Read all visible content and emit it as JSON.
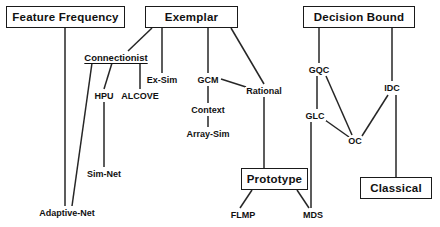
{
  "diagram": {
    "style": {
      "background": "#ffffff",
      "line_color": "#262626",
      "text_color": "#111111",
      "box_border": "#1a1a1a"
    },
    "boxes": [
      {
        "id": "feature-frequency",
        "label": "Feature Frequency",
        "x": 6,
        "y": 6,
        "w": 119,
        "h": 22,
        "font_size": 11.5
      },
      {
        "id": "exemplar",
        "label": "Exemplar",
        "x": 145,
        "y": 6,
        "w": 93,
        "h": 22,
        "font_size": 11.5
      },
      {
        "id": "decision-bound",
        "label": "Decision Bound",
        "x": 303,
        "y": 6,
        "w": 112,
        "h": 22,
        "font_size": 11.5
      },
      {
        "id": "prototype",
        "label": "Prototype",
        "x": 241,
        "y": 168,
        "w": 67,
        "h": 22,
        "font_size": 11.5
      },
      {
        "id": "classical",
        "label": "Classical",
        "x": 360,
        "y": 177,
        "w": 72,
        "h": 22,
        "font_size": 11.5
      }
    ],
    "labels": [
      {
        "id": "connectionist",
        "label": "Connectionist",
        "cx": 116,
        "cy": 58,
        "font_size": 9.5,
        "underlined": true
      },
      {
        "id": "hpu",
        "label": "HPU",
        "cx": 104,
        "cy": 96,
        "font_size": 9,
        "underlined": false
      },
      {
        "id": "alcove",
        "label": "ALCOVE",
        "cx": 140,
        "cy": 96,
        "font_size": 9,
        "underlined": false
      },
      {
        "id": "ex-sim",
        "label": "Ex-Sim",
        "cx": 162,
        "cy": 80,
        "font_size": 9,
        "underlined": false
      },
      {
        "id": "gcm",
        "label": "GCM",
        "cx": 208,
        "cy": 80,
        "font_size": 9,
        "underlined": false
      },
      {
        "id": "context",
        "label": "Context",
        "cx": 208,
        "cy": 110,
        "font_size": 9,
        "underlined": false
      },
      {
        "id": "array-sim",
        "label": "Array-Sim",
        "cx": 208,
        "cy": 134,
        "font_size": 9,
        "underlined": false
      },
      {
        "id": "rational",
        "label": "Rational",
        "cx": 264,
        "cy": 91,
        "font_size": 9,
        "underlined": false
      },
      {
        "id": "sim-net",
        "label": "Sim-Net",
        "cx": 104,
        "cy": 174,
        "font_size": 9,
        "underlined": false
      },
      {
        "id": "adaptive-net",
        "label": "Adaptive-Net",
        "cx": 67,
        "cy": 213,
        "font_size": 9,
        "underlined": false
      },
      {
        "id": "flmp",
        "label": "FLMP",
        "cx": 243,
        "cy": 215,
        "font_size": 9,
        "underlined": false
      },
      {
        "id": "mds",
        "label": "MDS",
        "cx": 313,
        "cy": 215,
        "font_size": 9,
        "underlined": false
      },
      {
        "id": "gqc",
        "label": "GQC",
        "cx": 319,
        "cy": 70,
        "font_size": 9,
        "underlined": false
      },
      {
        "id": "glc",
        "label": "GLC",
        "cx": 315,
        "cy": 116,
        "font_size": 9,
        "underlined": false
      },
      {
        "id": "oc",
        "label": "OC",
        "cx": 355,
        "cy": 141,
        "font_size": 9,
        "underlined": false
      },
      {
        "id": "idc",
        "label": "IDC",
        "cx": 392,
        "cy": 88,
        "font_size": 9,
        "underlined": false
      }
    ],
    "edges": [
      {
        "id": "feature-frequency-to-adaptive-net",
        "from": "feature-frequency",
        "to": "adaptive-net",
        "x1": 65,
        "y1": 28,
        "x2": 65,
        "y2": 206
      },
      {
        "id": "exemplar-to-connectionist",
        "from": "exemplar",
        "to": "connectionist",
        "x1": 152,
        "y1": 28,
        "x2": 128,
        "y2": 51
      },
      {
        "id": "exemplar-to-ex-sim",
        "from": "exemplar",
        "to": "ex-sim",
        "x1": 162,
        "y1": 28,
        "x2": 162,
        "y2": 73
      },
      {
        "id": "exemplar-to-gcm",
        "from": "exemplar",
        "to": "gcm",
        "x1": 208,
        "y1": 28,
        "x2": 208,
        "y2": 73
      },
      {
        "id": "exemplar-to-rational",
        "from": "exemplar",
        "to": "rational",
        "x1": 231,
        "y1": 28,
        "x2": 264,
        "y2": 84
      },
      {
        "id": "connectionist-to-adaptive-net",
        "from": "connectionist",
        "to": "adaptive-net",
        "x1": 92,
        "y1": 63,
        "x2": 72,
        "y2": 206
      },
      {
        "id": "connectionist-to-hpu",
        "from": "connectionist",
        "to": "hpu",
        "x1": 112,
        "y1": 63,
        "x2": 104,
        "y2": 89
      },
      {
        "id": "connectionist-to-alcove",
        "from": "connectionist",
        "to": "alcove",
        "x1": 140,
        "y1": 63,
        "x2": 140,
        "y2": 89
      },
      {
        "id": "hpu-to-sim-net",
        "from": "hpu",
        "to": "sim-net",
        "x1": 104,
        "y1": 102,
        "x2": 104,
        "y2": 167
      },
      {
        "id": "gcm-to-context",
        "from": "gcm",
        "to": "context",
        "x1": 208,
        "y1": 86,
        "x2": 208,
        "y2": 103
      },
      {
        "id": "context-to-array-sim",
        "from": "context",
        "to": "array-sim",
        "x1": 208,
        "y1": 116,
        "x2": 208,
        "y2": 127
      },
      {
        "id": "gcm-to-rational",
        "from": "gcm",
        "to": "rational",
        "x1": 221,
        "y1": 79,
        "x2": 246,
        "y2": 87
      },
      {
        "id": "rational-to-prototype",
        "from": "rational",
        "to": "prototype",
        "x1": 264,
        "y1": 97,
        "x2": 264,
        "y2": 168
      },
      {
        "id": "prototype-to-flmp",
        "from": "prototype",
        "to": "flmp",
        "x1": 252,
        "y1": 190,
        "x2": 240,
        "y2": 208
      },
      {
        "id": "prototype-to-mds",
        "from": "prototype",
        "to": "mds",
        "x1": 297,
        "y1": 190,
        "x2": 309,
        "y2": 208
      },
      {
        "id": "decision-bound-to-gqc",
        "from": "decision-bound",
        "to": "gqc",
        "x1": 319,
        "y1": 28,
        "x2": 319,
        "y2": 63
      },
      {
        "id": "decision-bound-to-idc",
        "from": "decision-bound",
        "to": "idc",
        "x1": 392,
        "y1": 28,
        "x2": 392,
        "y2": 81
      },
      {
        "id": "gqc-to-glc",
        "from": "gqc",
        "to": "glc",
        "x1": 317,
        "y1": 76,
        "x2": 317,
        "y2": 109
      },
      {
        "id": "gqc-to-oc",
        "from": "gqc",
        "to": "oc",
        "x1": 326,
        "y1": 76,
        "x2": 352,
        "y2": 135
      },
      {
        "id": "glc-to-oc",
        "from": "glc",
        "to": "oc",
        "x1": 325,
        "y1": 120,
        "x2": 349,
        "y2": 137
      },
      {
        "id": "idc-to-oc",
        "from": "idc",
        "to": "oc",
        "x1": 388,
        "y1": 95,
        "x2": 362,
        "y2": 136
      },
      {
        "id": "glc-to-mds",
        "from": "glc",
        "to": "mds",
        "x1": 311,
        "y1": 122,
        "x2": 311,
        "y2": 208
      },
      {
        "id": "idc-to-classical",
        "from": "idc",
        "to": "classical",
        "x1": 396,
        "y1": 95,
        "x2": 396,
        "y2": 177
      }
    ]
  }
}
